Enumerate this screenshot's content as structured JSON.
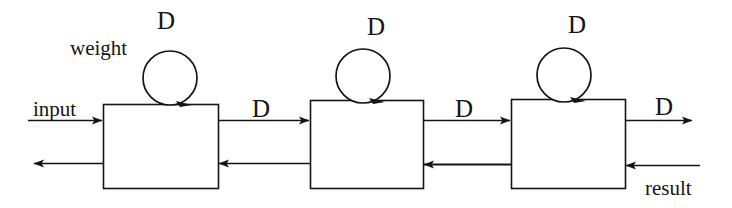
{
  "figure": {
    "type": "block-diagram",
    "background_color": "#ffffff",
    "ink_color": "#141414"
  },
  "labels": {
    "weight": "weight",
    "input": "input",
    "result": "result",
    "delay_block1_loop": "D",
    "delay_block2_loop": "D",
    "delay_block3_loop": "D",
    "delay_link_1_2": "D",
    "delay_link_2_3": "D",
    "delay_output": "D"
  },
  "blocks": [
    {
      "name": "processing-block-1",
      "x": 103,
      "y": 104,
      "width": 115,
      "height": 84
    },
    {
      "name": "processing-block-2",
      "x": 310,
      "y": 100,
      "width": 113,
      "height": 88
    },
    {
      "name": "processing-block-3",
      "x": 511,
      "y": 99,
      "width": 114,
      "height": 89
    }
  ],
  "self_loops": [
    {
      "name": "self-loop-1",
      "cx": 170,
      "cy": 78,
      "r": 27
    },
    {
      "name": "self-loop-2",
      "cx": 363,
      "cy": 76,
      "r": 27
    },
    {
      "name": "self-loop-3",
      "cx": 564,
      "cy": 75,
      "r": 27
    }
  ],
  "connections": [
    {
      "name": "input-arrow",
      "direction": "right",
      "from_x": 28,
      "to_x": 103,
      "y": 120
    },
    {
      "name": "forward-arrow-1-2",
      "direction": "right",
      "from_x": 218,
      "to_x": 310,
      "y": 120
    },
    {
      "name": "forward-arrow-2-3",
      "direction": "right",
      "from_x": 423,
      "to_x": 511,
      "y": 120
    },
    {
      "name": "output-arrow",
      "direction": "right",
      "from_x": 625,
      "to_x": 692,
      "y": 120
    },
    {
      "name": "feedback-arrow-out",
      "direction": "left",
      "from_x": 103,
      "to_x": 33,
      "y": 163
    },
    {
      "name": "feedback-arrow-2-1",
      "direction": "left",
      "from_x": 310,
      "to_x": 218,
      "y": 163
    },
    {
      "name": "feedback-arrow-3-2",
      "direction": "left",
      "from_x": 511,
      "to_x": 423,
      "y": 164
    },
    {
      "name": "result-arrow-in",
      "direction": "left",
      "from_x": 700,
      "to_x": 625,
      "y": 165
    }
  ]
}
